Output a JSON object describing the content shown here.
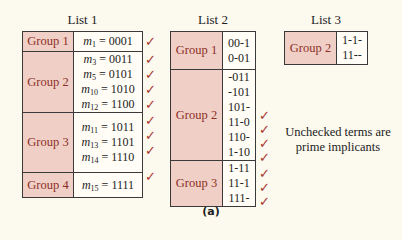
{
  "colors": {
    "background": "#fcf9ef",
    "group_fill": "#f0cfc6",
    "group_text": "#8c2f27",
    "check": "#a8352a"
  },
  "list1": {
    "title": "List 1",
    "groups": [
      {
        "label": "Group 1",
        "terms": [
          {
            "m": "m",
            "sub": "1",
            "bits": "= 0001",
            "checked": true
          }
        ]
      },
      {
        "label": "Group 2",
        "terms": [
          {
            "m": "m",
            "sub": "3",
            "bits": "= 0011",
            "checked": true
          },
          {
            "m": "m",
            "sub": "5",
            "bits": "= 0101",
            "checked": true
          },
          {
            "m": "m",
            "sub": "10",
            "bits": "= 1010",
            "checked": true
          },
          {
            "m": "m",
            "sub": "12",
            "bits": "= 1100",
            "checked": true
          }
        ]
      },
      {
        "label": "Group 3",
        "terms": [
          {
            "m": "m",
            "sub": "11",
            "bits": "= 1011",
            "checked": true
          },
          {
            "m": "m",
            "sub": "13",
            "bits": "= 1101",
            "checked": true
          },
          {
            "m": "m",
            "sub": "14",
            "bits": "= 1110",
            "checked": true
          }
        ]
      },
      {
        "label": "Group 4",
        "terms": [
          {
            "m": "m",
            "sub": "15",
            "bits": "= 1111",
            "checked": true
          }
        ]
      }
    ]
  },
  "list2": {
    "title": "List 2",
    "groups": [
      {
        "label": "Group 1",
        "terms": [
          {
            "bits": "00-1",
            "checked": false
          },
          {
            "bits": "0-01",
            "checked": false
          }
        ]
      },
      {
        "label": "Group 2",
        "terms": [
          {
            "bits": "-011",
            "checked": false
          },
          {
            "bits": "-101",
            "checked": false
          },
          {
            "bits": "101-",
            "checked": true
          },
          {
            "bits": "11-0",
            "checked": true
          },
          {
            "bits": "110-",
            "checked": true
          },
          {
            "bits": "1-10",
            "checked": true
          }
        ]
      },
      {
        "label": "Group 3",
        "terms": [
          {
            "bits": "1-11",
            "checked": true
          },
          {
            "bits": "11-1",
            "checked": true
          },
          {
            "bits": "111-",
            "checked": true
          }
        ]
      }
    ]
  },
  "list3": {
    "title": "List 3",
    "groups": [
      {
        "label": "Group 2",
        "terms": [
          {
            "bits": "1-1-",
            "checked": false
          },
          {
            "bits": "11--",
            "checked": false
          }
        ]
      }
    ]
  },
  "check_glyph": "✓",
  "note": {
    "line1": "Unchecked terms are",
    "line2": "prime implicants"
  },
  "caption": "(a)"
}
